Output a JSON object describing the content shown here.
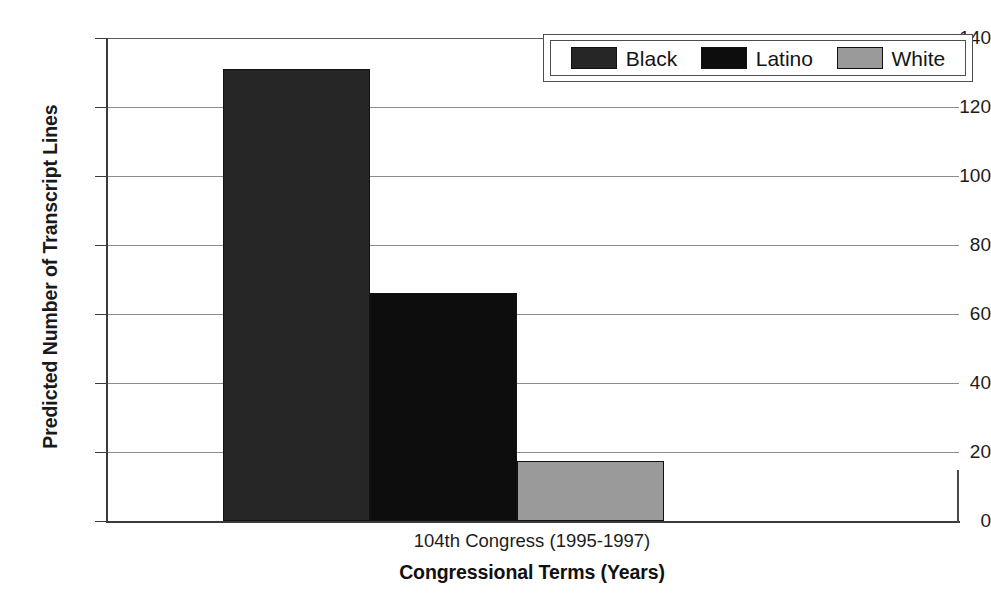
{
  "chart_data": {
    "type": "bar",
    "title": "",
    "categories": [
      "104th Congress (1995-1997)"
    ],
    "series": [
      {
        "name": "Black",
        "values": [
          131
        ],
        "color": "#262626"
      },
      {
        "name": "Latino",
        "values": [
          66
        ],
        "color": "#0d0d0d"
      },
      {
        "name": "White",
        "values": [
          17.5
        ],
        "color": "#9a9a9a"
      }
    ],
    "xlabel": "Congressional Terms (Years)",
    "ylabel": "Predicted Number of Transcript Lines",
    "ylim": [
      0,
      140
    ],
    "yticks": [
      0,
      20,
      40,
      60,
      80,
      100,
      120,
      140
    ],
    "ytick_labels": [
      "0",
      "20",
      "40",
      "60",
      "80",
      "100",
      "120",
      "140"
    ],
    "xtick_labels": [
      "104th Congress (1995-1997)"
    ],
    "grid": "horizontal",
    "legend_position": "top-right",
    "bar_layout": "adjacent-no-gap"
  },
  "axes": {
    "y_title": "Predicted Number of Transcript Lines",
    "x_title": "Congressional Terms (Years)",
    "x_tick": "104th Congress (1995-1997)",
    "y_labels": {
      "t0": "0",
      "t20": "20",
      "t40": "40",
      "t60": "60",
      "t80": "80",
      "t100": "100",
      "t120": "120",
      "t140": "140"
    }
  },
  "legend": {
    "items": [
      {
        "label": "Black",
        "color": "#262626"
      },
      {
        "label": "Latino",
        "color": "#0d0d0d"
      },
      {
        "label": "White",
        "color": "#9a9a9a"
      }
    ]
  },
  "bars": [
    {
      "label": "Black",
      "value": 131
    },
    {
      "label": "Latino",
      "value": 66
    },
    {
      "label": "White",
      "value": 17.5
    }
  ],
  "colors": {
    "black_series": "#262626",
    "latino_series": "#0d0d0d",
    "white_series": "#9a9a9a",
    "axis": "#3a3a3a",
    "grid": "#8c8c8c",
    "background": "#ffffff"
  }
}
